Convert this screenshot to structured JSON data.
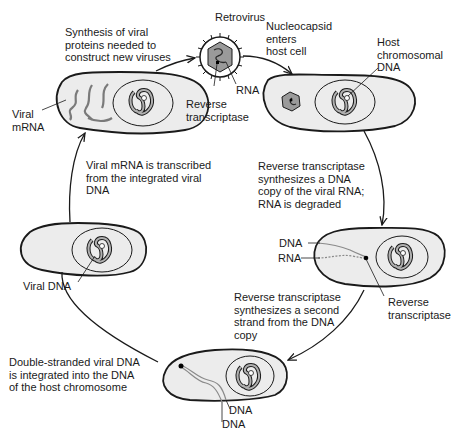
{
  "diagram": {
    "colors": {
      "cell_fill": "#ececec",
      "outline": "#1a1a1a",
      "capsid_fill": "#9a9a9a",
      "nucleic_strand": "#7a7a7a",
      "background": "#ffffff"
    },
    "labels": {
      "retrovirus": "Retrovirus",
      "rna": "RNA",
      "reverse_transcriptase_top": "Reverse\ntranscriptase",
      "synthesis_step": "Synthesis of viral\nproteins needed to\nconstruct new viruses",
      "nucleocapsid_step": "Nucleocapsid\nenters\nhost cell",
      "host_chromosomal_dna": "Host\nchromosomal\nDNA",
      "viral_mrna": "Viral\nmRNA",
      "rt_dna_copy_step": "Reverse transcriptase\nsynthesizes a DNA\ncopy of the viral RNA;\nRNA is degraded",
      "mrna_transcribed_step": "Viral mRNA is transcribed\nfrom the integrated viral\nDNA",
      "dna_label_cell3": "DNA",
      "rna_label_cell3": "RNA",
      "reverse_transcriptase_cell3": "Reverse\ntranscriptase",
      "second_strand_step": "Reverse transcriptase\nsynthesizes a second\nstrand from the DNA\ncopy",
      "viral_dna": "Viral DNA",
      "integration_step": "Double-stranded viral DNA\nis integrated into the DNA\nof the host chromosome",
      "dna_strand_1": "DNA",
      "dna_strand_2": "DNA"
    }
  }
}
